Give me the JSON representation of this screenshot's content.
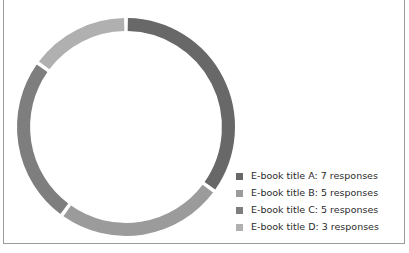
{
  "clipped_heading": "Pie Chart",
  "panel": {
    "border_color": "#9a9a9a",
    "background": "#ffffff"
  },
  "chart_data": {
    "type": "pie",
    "variant": "donut",
    "title": "",
    "xlabel": "",
    "ylabel": "",
    "unit": "responses",
    "total": 20,
    "start_angle_deg": 0,
    "direction": "clockwise",
    "inner_radius_ratio": 0.88,
    "gap_deg": 2,
    "legend_position": "right",
    "grid": false,
    "categories": [
      "E-book title A",
      "E-book title B",
      "E-book title C",
      "E-book title D"
    ],
    "values": [
      7,
      5,
      5,
      3
    ],
    "colors": [
      "#686868",
      "#9b9b9b",
      "#7e7e7e",
      "#b0b0b0"
    ],
    "slices": [
      {
        "label": "E-book title A",
        "value": 7,
        "color": "#686868",
        "legend_text": "E-book title A: 7 responses"
      },
      {
        "label": "E-book title B",
        "value": 5,
        "color": "#9b9b9b",
        "legend_text": "E-book title B: 5 responses"
      },
      {
        "label": "E-book title C",
        "value": 5,
        "color": "#7e7e7e",
        "legend_text": "E-book title C: 5 responses"
      },
      {
        "label": "E-book title D",
        "value": 3,
        "color": "#b0b0b0",
        "legend_text": "E-book title D: 3 responses"
      }
    ]
  },
  "legend": {
    "items": [
      {
        "text": "E-book title A: 7 responses",
        "color": "#686868"
      },
      {
        "text": "E-book title B: 5 responses",
        "color": "#9b9b9b"
      },
      {
        "text": "E-book title C: 5 responses",
        "color": "#7e7e7e"
      },
      {
        "text": "E-book title D: 3 responses",
        "color": "#b0b0b0"
      }
    ]
  }
}
